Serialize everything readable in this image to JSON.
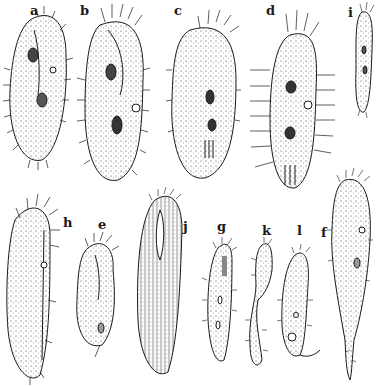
{
  "figure": {
    "ink_color": "#1a1a1a",
    "background": "#ffffff",
    "labels": [
      {
        "id": "a",
        "text": "a",
        "x": 30,
        "y": 4
      },
      {
        "id": "b",
        "text": "b",
        "x": 80,
        "y": 4
      },
      {
        "id": "c",
        "text": "c",
        "x": 174,
        "y": 4
      },
      {
        "id": "d",
        "text": "d",
        "x": 266,
        "y": 4
      },
      {
        "id": "i",
        "text": "i",
        "x": 348,
        "y": 6
      },
      {
        "id": "h",
        "text": "h",
        "x": 63,
        "y": 216
      },
      {
        "id": "e",
        "text": "e",
        "x": 98,
        "y": 218
      },
      {
        "id": "j",
        "text": "j",
        "x": 183,
        "y": 220
      },
      {
        "id": "g",
        "text": "g",
        "x": 217,
        "y": 220
      },
      {
        "id": "k",
        "text": "k",
        "x": 262,
        "y": 224
      },
      {
        "id": "l",
        "text": "l",
        "x": 297,
        "y": 224
      },
      {
        "id": "f",
        "text": "f",
        "x": 321,
        "y": 226
      }
    ]
  }
}
